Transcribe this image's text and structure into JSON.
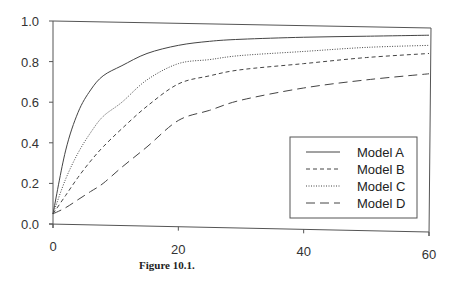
{
  "caption": "Figure 10.1.",
  "chart_data": {
    "type": "line",
    "title": "",
    "xlabel": "",
    "ylabel": "",
    "xlim": [
      0,
      60
    ],
    "ylim": [
      0.0,
      1.0
    ],
    "x_ticks": [
      "0",
      "20",
      "40",
      "60"
    ],
    "y_ticks": [
      "0.0",
      "0.2",
      "0.4",
      "0.6",
      "0.8",
      "1.0"
    ],
    "grid": false,
    "legend_position": "lower right",
    "x": [
      0,
      2,
      4,
      6,
      8,
      11,
      15,
      20,
      25,
      30,
      40,
      50,
      60
    ],
    "series": [
      {
        "name": "Model A",
        "style": "solid",
        "values": [
          0.05,
          0.36,
          0.55,
          0.66,
          0.73,
          0.78,
          0.84,
          0.88,
          0.9,
          0.91,
          0.92,
          0.925,
          0.93
        ]
      },
      {
        "name": "Model B",
        "style": "short-dash",
        "values": [
          0.05,
          0.14,
          0.23,
          0.31,
          0.38,
          0.47,
          0.58,
          0.69,
          0.73,
          0.76,
          0.79,
          0.82,
          0.84
        ]
      },
      {
        "name": "Model C",
        "style": "dotted",
        "values": [
          0.05,
          0.22,
          0.35,
          0.45,
          0.53,
          0.6,
          0.71,
          0.79,
          0.81,
          0.83,
          0.85,
          0.87,
          0.88
        ]
      },
      {
        "name": "Model D",
        "style": "long-dash",
        "values": [
          0.05,
          0.08,
          0.12,
          0.16,
          0.2,
          0.28,
          0.38,
          0.51,
          0.56,
          0.61,
          0.67,
          0.71,
          0.74
        ]
      }
    ]
  },
  "legend": {
    "items": [
      {
        "label": "Model A",
        "dash": ""
      },
      {
        "label": "Model B",
        "dash": "4,3"
      },
      {
        "label": "Model C",
        "dash": "1,1.5"
      },
      {
        "label": "Model D",
        "dash": "9,5"
      }
    ]
  }
}
